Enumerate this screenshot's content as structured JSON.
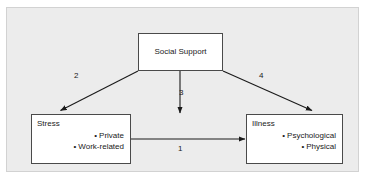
{
  "figure": {
    "background_color": "#ffffff",
    "panel_color": "#ececec",
    "panel_border_color": "#d2d2d2",
    "box_border_color": "#4a4a4a",
    "box_fill_color": "#ffffff",
    "line_color": "#1a1a1a",
    "text_color": "#1a1a1a"
  },
  "nodes": {
    "social_support": {
      "title": "Social Support"
    },
    "stress": {
      "title": "Stress",
      "items": [
        "Private",
        "Work-related"
      ]
    },
    "illness": {
      "title": "Illness",
      "items": [
        "Psychological",
        "Physical"
      ]
    }
  },
  "edges": [
    {
      "id": "1",
      "label": "1",
      "from": "stress",
      "to": "illness",
      "style": "solid-arrow"
    },
    {
      "id": "2",
      "label": "2",
      "from": "social_support",
      "to": "stress",
      "style": "solid-arrow"
    },
    {
      "id": "3",
      "label": "3",
      "from": "social_support",
      "to": "stress-illness-link",
      "style": "solid-arrow"
    },
    {
      "id": "4",
      "label": "4",
      "from": "social_support",
      "to": "illness",
      "style": "solid-arrow"
    }
  ],
  "bullet_glyph": "•"
}
